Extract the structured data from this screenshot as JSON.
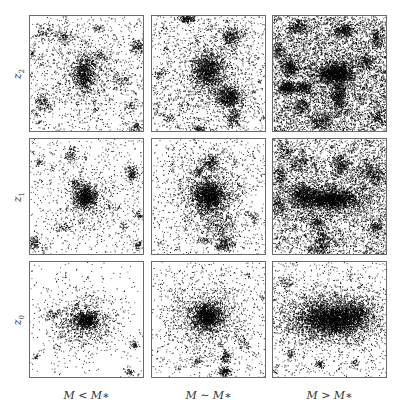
{
  "figure": {
    "background": "#ffffff",
    "border_color": "#6a6a6a",
    "particle_color": "#000000",
    "rows": [
      {
        "label": "z",
        "subscript": "2"
      },
      {
        "label": "z",
        "subscript": "1"
      },
      {
        "label": "z",
        "subscript": "0"
      }
    ],
    "columns": [
      {
        "label": "M < M∗"
      },
      {
        "label": "M ∼ M∗"
      },
      {
        "label": "M > M∗"
      }
    ],
    "layout": {
      "col_x": [
        29,
        151,
        272
      ],
      "row_y": [
        15,
        138,
        261
      ],
      "panel_w": 115,
      "panel_h": 117
    },
    "panels": [
      {
        "row": 0,
        "col": 0,
        "name": "z2-low-mass",
        "background_density": 900,
        "clusters": [
          {
            "x": 0.48,
            "y": 0.5,
            "sx": 0.05,
            "sy": 0.08,
            "n": 700
          },
          {
            "x": 0.48,
            "y": 0.5,
            "sx": 0.16,
            "sy": 0.18,
            "n": 500
          },
          {
            "x": 0.94,
            "y": 0.26,
            "sx": 0.03,
            "sy": 0.03,
            "n": 120
          },
          {
            "x": 0.12,
            "y": 0.76,
            "sx": 0.04,
            "sy": 0.04,
            "n": 140
          },
          {
            "x": 0.94,
            "y": 0.96,
            "sx": 0.02,
            "sy": 0.02,
            "n": 60
          },
          {
            "x": 0.12,
            "y": 0.14,
            "sx": 0.05,
            "sy": 0.03,
            "n": 80
          },
          {
            "x": 0.3,
            "y": 0.18,
            "sx": 0.05,
            "sy": 0.03,
            "n": 110
          },
          {
            "x": 0.62,
            "y": 0.35,
            "sx": 0.04,
            "sy": 0.03,
            "n": 60
          },
          {
            "x": 0.8,
            "y": 0.55,
            "sx": 0.06,
            "sy": 0.04,
            "n": 70
          },
          {
            "x": 0.6,
            "y": 0.1,
            "sx": 0.03,
            "sy": 0.02,
            "n": 40
          },
          {
            "x": 0.02,
            "y": 0.32,
            "sx": 0.02,
            "sy": 0.03,
            "n": 40
          },
          {
            "x": 0.88,
            "y": 0.78,
            "sx": 0.03,
            "sy": 0.03,
            "n": 50
          }
        ]
      },
      {
        "row": 0,
        "col": 1,
        "name": "z2-mid-mass",
        "background_density": 1100,
        "clusters": [
          {
            "x": 0.49,
            "y": 0.47,
            "sx": 0.07,
            "sy": 0.08,
            "n": 1100
          },
          {
            "x": 0.5,
            "y": 0.5,
            "sx": 0.22,
            "sy": 0.24,
            "n": 900
          },
          {
            "x": 0.68,
            "y": 0.7,
            "sx": 0.06,
            "sy": 0.05,
            "n": 700
          },
          {
            "x": 0.72,
            "y": 0.88,
            "sx": 0.04,
            "sy": 0.05,
            "n": 200
          },
          {
            "x": 0.7,
            "y": 0.18,
            "sx": 0.05,
            "sy": 0.05,
            "n": 300
          },
          {
            "x": 0.3,
            "y": 0.02,
            "sx": 0.04,
            "sy": 0.02,
            "n": 160
          },
          {
            "x": 0.42,
            "y": 0.98,
            "sx": 0.03,
            "sy": 0.02,
            "n": 80
          },
          {
            "x": 0.05,
            "y": 0.5,
            "sx": 0.02,
            "sy": 0.02,
            "n": 30
          },
          {
            "x": 0.15,
            "y": 0.88,
            "sx": 0.03,
            "sy": 0.02,
            "n": 40
          }
        ]
      },
      {
        "row": 0,
        "col": 2,
        "name": "z2-high-mass",
        "background_density": 4200,
        "clusters": [
          {
            "x": 0.52,
            "y": 0.5,
            "sx": 0.07,
            "sy": 0.05,
            "n": 900
          },
          {
            "x": 0.62,
            "y": 0.48,
            "sx": 0.06,
            "sy": 0.05,
            "n": 500
          },
          {
            "x": 0.58,
            "y": 0.7,
            "sx": 0.03,
            "sy": 0.08,
            "n": 450
          },
          {
            "x": 0.14,
            "y": 0.44,
            "sx": 0.04,
            "sy": 0.04,
            "n": 350
          },
          {
            "x": 0.12,
            "y": 0.62,
            "sx": 0.04,
            "sy": 0.03,
            "n": 350
          },
          {
            "x": 0.26,
            "y": 0.62,
            "sx": 0.05,
            "sy": 0.03,
            "n": 250
          },
          {
            "x": 0.62,
            "y": 0.12,
            "sx": 0.05,
            "sy": 0.03,
            "n": 300
          },
          {
            "x": 0.22,
            "y": 0.1,
            "sx": 0.05,
            "sy": 0.03,
            "n": 200
          },
          {
            "x": 0.04,
            "y": 0.3,
            "sx": 0.03,
            "sy": 0.04,
            "n": 150
          },
          {
            "x": 0.42,
            "y": 0.92,
            "sx": 0.05,
            "sy": 0.04,
            "n": 250
          },
          {
            "x": 0.26,
            "y": 0.78,
            "sx": 0.04,
            "sy": 0.04,
            "n": 180
          },
          {
            "x": 0.92,
            "y": 0.88,
            "sx": 0.04,
            "sy": 0.04,
            "n": 150
          },
          {
            "x": 0.92,
            "y": 0.2,
            "sx": 0.03,
            "sy": 0.04,
            "n": 150
          },
          {
            "x": 0.8,
            "y": 0.4,
            "sx": 0.05,
            "sy": 0.04,
            "n": 150
          },
          {
            "x": 0.5,
            "y": 0.5,
            "sx": 0.3,
            "sy": 0.3,
            "n": 1200
          }
        ]
      },
      {
        "row": 1,
        "col": 0,
        "name": "z1-low-mass",
        "background_density": 700,
        "clusters": [
          {
            "x": 0.49,
            "y": 0.5,
            "sx": 0.05,
            "sy": 0.05,
            "n": 700
          },
          {
            "x": 0.49,
            "y": 0.52,
            "sx": 0.13,
            "sy": 0.13,
            "n": 450
          },
          {
            "x": 0.9,
            "y": 0.3,
            "sx": 0.03,
            "sy": 0.04,
            "n": 150
          },
          {
            "x": 0.35,
            "y": 0.14,
            "sx": 0.03,
            "sy": 0.03,
            "n": 80
          },
          {
            "x": 0.08,
            "y": 0.2,
            "sx": 0.02,
            "sy": 0.02,
            "n": 40
          },
          {
            "x": 0.4,
            "y": 0.38,
            "sx": 0.03,
            "sy": 0.02,
            "n": 60
          },
          {
            "x": 0.04,
            "y": 0.9,
            "sx": 0.03,
            "sy": 0.03,
            "n": 90
          },
          {
            "x": 0.95,
            "y": 0.92,
            "sx": 0.02,
            "sy": 0.02,
            "n": 50
          },
          {
            "x": 0.96,
            "y": 0.66,
            "sx": 0.02,
            "sy": 0.02,
            "n": 40
          },
          {
            "x": 0.82,
            "y": 0.76,
            "sx": 0.02,
            "sy": 0.02,
            "n": 30
          },
          {
            "x": 0.28,
            "y": 0.76,
            "sx": 0.04,
            "sy": 0.03,
            "n": 40
          }
        ]
      },
      {
        "row": 1,
        "col": 1,
        "name": "z1-mid-mass",
        "background_density": 900,
        "clusters": [
          {
            "x": 0.5,
            "y": 0.49,
            "sx": 0.07,
            "sy": 0.07,
            "n": 1500
          },
          {
            "x": 0.5,
            "y": 0.5,
            "sx": 0.17,
            "sy": 0.18,
            "n": 800
          },
          {
            "x": 0.52,
            "y": 0.2,
            "sx": 0.04,
            "sy": 0.04,
            "n": 220
          },
          {
            "x": 0.64,
            "y": 0.92,
            "sx": 0.04,
            "sy": 0.04,
            "n": 200
          },
          {
            "x": 0.6,
            "y": 0.76,
            "sx": 0.08,
            "sy": 0.08,
            "n": 250
          },
          {
            "x": 0.42,
            "y": 0.28,
            "sx": 0.03,
            "sy": 0.02,
            "n": 60
          },
          {
            "x": 0.9,
            "y": 0.68,
            "sx": 0.02,
            "sy": 0.03,
            "n": 40
          },
          {
            "x": 0.46,
            "y": 0.88,
            "sx": 0.03,
            "sy": 0.02,
            "n": 40
          }
        ]
      },
      {
        "row": 1,
        "col": 2,
        "name": "z1-high-mass",
        "background_density": 3600,
        "clusters": [
          {
            "x": 0.52,
            "y": 0.52,
            "sx": 0.12,
            "sy": 0.04,
            "n": 1500
          },
          {
            "x": 0.28,
            "y": 0.48,
            "sx": 0.07,
            "sy": 0.05,
            "n": 600
          },
          {
            "x": 0.5,
            "y": 0.52,
            "sx": 0.3,
            "sy": 0.12,
            "n": 900
          },
          {
            "x": 0.6,
            "y": 0.22,
            "sx": 0.04,
            "sy": 0.04,
            "n": 250
          },
          {
            "x": 0.88,
            "y": 0.3,
            "sx": 0.06,
            "sy": 0.05,
            "n": 300
          },
          {
            "x": 0.22,
            "y": 0.22,
            "sx": 0.05,
            "sy": 0.04,
            "n": 150
          },
          {
            "x": 0.06,
            "y": 0.32,
            "sx": 0.03,
            "sy": 0.05,
            "n": 150
          },
          {
            "x": 0.04,
            "y": 0.55,
            "sx": 0.03,
            "sy": 0.04,
            "n": 120
          },
          {
            "x": 0.38,
            "y": 0.72,
            "sx": 0.04,
            "sy": 0.04,
            "n": 150
          },
          {
            "x": 0.44,
            "y": 0.86,
            "sx": 0.04,
            "sy": 0.04,
            "n": 150
          },
          {
            "x": 0.42,
            "y": 0.94,
            "sx": 0.04,
            "sy": 0.03,
            "n": 150
          },
          {
            "x": 0.9,
            "y": 0.76,
            "sx": 0.03,
            "sy": 0.04,
            "n": 120
          },
          {
            "x": 0.1,
            "y": 0.1,
            "sx": 0.04,
            "sy": 0.03,
            "n": 100
          }
        ]
      },
      {
        "row": 2,
        "col": 0,
        "name": "z0-low-mass",
        "background_density": 250,
        "clusters": [
          {
            "x": 0.49,
            "y": 0.5,
            "sx": 0.05,
            "sy": 0.04,
            "n": 600
          },
          {
            "x": 0.46,
            "y": 0.52,
            "sx": 0.16,
            "sy": 0.12,
            "n": 900
          },
          {
            "x": 0.2,
            "y": 0.45,
            "sx": 0.03,
            "sy": 0.02,
            "n": 60
          },
          {
            "x": 0.92,
            "y": 0.72,
            "sx": 0.02,
            "sy": 0.02,
            "n": 50
          },
          {
            "x": 0.88,
            "y": 0.95,
            "sx": 0.02,
            "sy": 0.02,
            "n": 40
          },
          {
            "x": 0.05,
            "y": 0.82,
            "sx": 0.02,
            "sy": 0.02,
            "n": 20
          }
        ]
      },
      {
        "row": 2,
        "col": 1,
        "name": "z0-mid-mass",
        "background_density": 500,
        "clusters": [
          {
            "x": 0.48,
            "y": 0.47,
            "sx": 0.07,
            "sy": 0.06,
            "n": 1300
          },
          {
            "x": 0.48,
            "y": 0.48,
            "sx": 0.2,
            "sy": 0.18,
            "n": 1100
          },
          {
            "x": 0.65,
            "y": 0.82,
            "sx": 0.02,
            "sy": 0.03,
            "n": 100
          },
          {
            "x": 0.64,
            "y": 0.95,
            "sx": 0.03,
            "sy": 0.02,
            "n": 160
          },
          {
            "x": 0.4,
            "y": 0.85,
            "sx": 0.03,
            "sy": 0.02,
            "n": 40
          },
          {
            "x": 0.8,
            "y": 0.7,
            "sx": 0.03,
            "sy": 0.03,
            "n": 50
          }
        ]
      },
      {
        "row": 2,
        "col": 2,
        "name": "z0-high-mass",
        "background_density": 700,
        "clusters": [
          {
            "x": 0.52,
            "y": 0.5,
            "sx": 0.14,
            "sy": 0.07,
            "n": 2500
          },
          {
            "x": 0.48,
            "y": 0.47,
            "sx": 0.3,
            "sy": 0.14,
            "n": 2200
          },
          {
            "x": 0.75,
            "y": 0.44,
            "sx": 0.06,
            "sy": 0.05,
            "n": 400
          },
          {
            "x": 0.15,
            "y": 0.8,
            "sx": 0.02,
            "sy": 0.02,
            "n": 50
          },
          {
            "x": 0.41,
            "y": 0.88,
            "sx": 0.02,
            "sy": 0.02,
            "n": 60
          },
          {
            "x": 0.72,
            "y": 0.88,
            "sx": 0.02,
            "sy": 0.02,
            "n": 40
          },
          {
            "x": 0.14,
            "y": 0.16,
            "sx": 0.03,
            "sy": 0.02,
            "n": 40
          }
        ]
      }
    ]
  }
}
